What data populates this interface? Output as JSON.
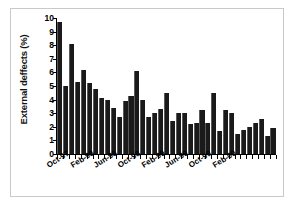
{
  "chart_data": {
    "type": "bar",
    "title": "",
    "xlabel": "",
    "ylabel": "External deffects (%)",
    "ylim": [
      0,
      10
    ],
    "ytick_labels": [
      "0",
      "1",
      "2",
      "3",
      "4",
      "5",
      "6",
      "7",
      "8",
      "9",
      "10"
    ],
    "ytick_values": [
      0,
      1,
      2,
      3,
      4,
      5,
      6,
      7,
      8,
      9,
      10
    ],
    "grid": false,
    "legend": "none",
    "bar_color": "#1a1a1a",
    "xtick_labels": [
      "Oct-97",
      "Feb-98",
      "Jun-98",
      "Oct-98",
      "Feb-99",
      "Jun-99",
      "Oct-99",
      "Feb-00"
    ],
    "xtick_indices": [
      0,
      4,
      8,
      12,
      16,
      20,
      24,
      28
    ],
    "categories": [
      "Oct-97",
      "Nov-97",
      "Dec-97",
      "Jan-98",
      "Feb-98",
      "Mar-98",
      "Apr-98",
      "May-98",
      "Jun-98",
      "Jul-98",
      "Aug-98",
      "Sep-98",
      "Oct-98",
      "Nov-98",
      "Dec-98",
      "Jan-99",
      "Feb-99",
      "Mar-99",
      "Apr-99",
      "May-99",
      "Jun-99",
      "Jul-99",
      "Aug-99",
      "Sep-99",
      "Oct-99",
      "Nov-99",
      "Dec-99",
      "Jan-00",
      "Feb-00",
      "Mar-00",
      "Apr-00",
      "May-00"
    ],
    "values": [
      9.7,
      5.0,
      8.1,
      5.3,
      6.2,
      5.2,
      4.8,
      4.1,
      4.0,
      3.4,
      2.7,
      3.9,
      4.3,
      6.1,
      4.0,
      2.7,
      3.0,
      3.3,
      4.5,
      2.4,
      3.0,
      3.0,
      2.2,
      2.3,
      3.2,
      2.3,
      4.5,
      1.7,
      3.2,
      3.0,
      1.5,
      1.8
    ],
    "values_tail": [
      2.0,
      2.3,
      2.6,
      1.3,
      1.9
    ]
  }
}
